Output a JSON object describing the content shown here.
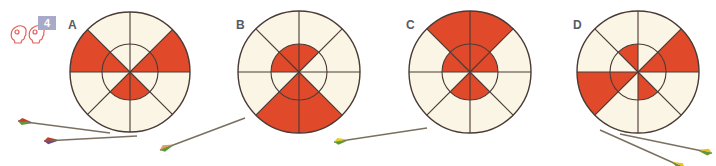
{
  "exercise": {
    "number": "4",
    "icon": "pair-work-icon"
  },
  "colors": {
    "red": "#e04a2a",
    "cream": "#faf5e4",
    "line": "#4a3a35",
    "badge": "#a9a9c9"
  },
  "targets": [
    {
      "label": "A",
      "cx": 130,
      "cy": 72,
      "r": 60,
      "ri": 28,
      "label_x": 68,
      "label_y": 18,
      "red_outer": [
        [
          180,
          225
        ],
        [
          315,
          360
        ]
      ],
      "red_inner": [
        [
          180,
          225
        ],
        [
          315,
          360
        ],
        [
          45,
          90
        ],
        [
          90,
          135
        ]
      ]
    },
    {
      "label": "B",
      "cx": 299,
      "cy": 72,
      "r": 61,
      "ri": 28,
      "label_x": 236,
      "label_y": 18,
      "red_outer": [
        [
          45,
          90
        ],
        [
          90,
          135
        ]
      ],
      "red_inner": [
        [
          180,
          225
        ],
        [
          225,
          270
        ],
        [
          270,
          315
        ],
        [
          45,
          90
        ],
        [
          90,
          135
        ]
      ]
    },
    {
      "label": "C",
      "cx": 470,
      "cy": 72,
      "r": 61,
      "ri": 28,
      "label_x": 406,
      "label_y": 18,
      "red_outer": [
        [
          225,
          270
        ],
        [
          270,
          315
        ]
      ],
      "red_inner": [
        [
          180,
          225
        ],
        [
          225,
          270
        ],
        [
          270,
          315
        ],
        [
          315,
          360
        ],
        [
          45,
          90
        ],
        [
          90,
          135
        ]
      ]
    },
    {
      "label": "D",
      "cx": 638,
      "cy": 72,
      "r": 61,
      "ri": 28,
      "label_x": 573,
      "label_y": 18,
      "red_outer": [
        [
          315,
          360
        ],
        [
          135,
          180
        ]
      ],
      "red_inner": [
        [
          315,
          360
        ],
        [
          135,
          180
        ],
        [
          225,
          270
        ],
        [
          45,
          90
        ]
      ]
    }
  ],
  "arrows": [
    {
      "tail": [
        18,
        121
      ],
      "tip": [
        110,
        133
      ],
      "fletch": [
        "#5a9a3a",
        "#c0402a"
      ]
    },
    {
      "tail": [
        44,
        141
      ],
      "tip": [
        137,
        136
      ],
      "fletch": [
        "#6a4a8a",
        "#c0402a"
      ]
    },
    {
      "tail": [
        160,
        150
      ],
      "tip": [
        245,
        118
      ],
      "fletch": [
        "#5a9a3a",
        "#e0a060"
      ]
    },
    {
      "tail": [
        334,
        142
      ],
      "tip": [
        427,
        128
      ],
      "fletch": [
        "#5a9a3a",
        "#e8d020"
      ]
    },
    {
      "tail": [
        712,
        153
      ],
      "tip": [
        620,
        134
      ],
      "fletch": [
        "#e8c020",
        "#5a9a3a"
      ]
    },
    {
      "tail": [
        685,
        168
      ],
      "tip": [
        600,
        130
      ],
      "fletch": [
        "#e8c020",
        "#5a9a3a"
      ]
    }
  ]
}
